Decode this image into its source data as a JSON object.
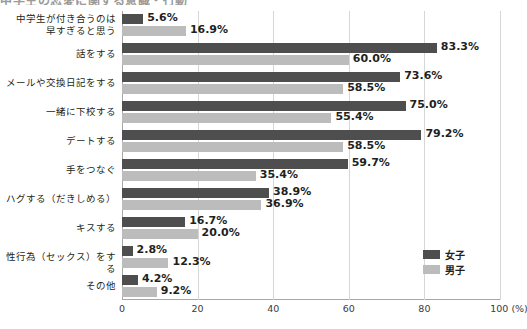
{
  "title_sliver": "中学生の恋愛に関する意識・行動",
  "legend": {
    "position": "bottom-right",
    "items": [
      {
        "name": "女子",
        "color": "#4e4e4e",
        "key": "female"
      },
      {
        "name": "男子",
        "color": "#bcbcbc",
        "key": "male"
      }
    ]
  },
  "axis": {
    "unit_label": "100 (%)",
    "ticks": [
      "0",
      "20",
      "40",
      "60",
      "80",
      "100 (%)"
    ]
  },
  "chart_data": {
    "type": "bar",
    "orientation": "horizontal",
    "title": "中学生の恋愛に関する意識・行動",
    "xlabel": "(%)",
    "ylabel": "",
    "xlim": [
      0,
      100
    ],
    "grid": true,
    "legend_position": "bottom-right",
    "categories": [
      "中学生が付き合うのは\n早すぎると思う",
      "話をする",
      "メールや交換日記をする",
      "一緒に下校する",
      "デートする",
      "手をつなぐ",
      "ハグする（だきしめる）",
      "キスする",
      "性行為（セックス）をする",
      "その他"
    ],
    "series": [
      {
        "name": "女子",
        "color": "#4e4e4e",
        "values": [
          5.6,
          83.3,
          73.6,
          75.0,
          79.2,
          59.7,
          38.9,
          16.7,
          2.8,
          4.2
        ],
        "labels": [
          "5.6%",
          "83.3%",
          "73.6%",
          "75.0%",
          "79.2%",
          "59.7%",
          "38.9%",
          "16.7%",
          "2.8%",
          "4.2%"
        ]
      },
      {
        "name": "男子",
        "color": "#bcbcbc",
        "values": [
          16.9,
          60.0,
          58.5,
          55.4,
          58.5,
          35.4,
          36.9,
          20.0,
          12.3,
          9.2
        ],
        "labels": [
          "16.9%",
          "60.0%",
          "58.5%",
          "55.4%",
          "58.5%",
          "35.4%",
          "36.9%",
          "20.0%",
          "12.3%",
          "9.2%"
        ]
      }
    ]
  }
}
